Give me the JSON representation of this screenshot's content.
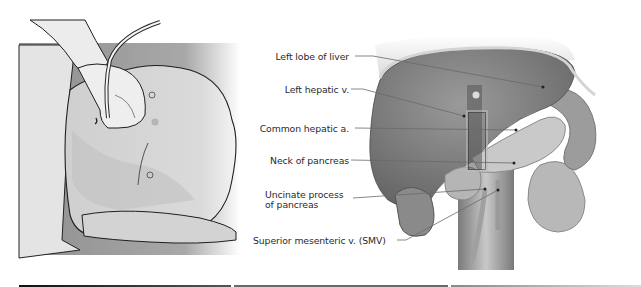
{
  "figure": {
    "left_panel": {
      "description": "Patient supine with ultrasound transducer placed on upper abdomen",
      "icons": [
        "transducer-icon",
        "hand-icon",
        "patient-torso-icon"
      ]
    },
    "right_panel": {
      "labels": [
        {
          "id": "left-lobe-liver",
          "text": "Left lobe of liver"
        },
        {
          "id": "left-hepatic-v",
          "text": "Left hepatic v."
        },
        {
          "id": "common-hepatic-a",
          "text": "Common hepatic a."
        },
        {
          "id": "neck-pancreas",
          "text": "Neck of pancreas"
        },
        {
          "id": "uncinate-line1",
          "text": "Uncinate process"
        },
        {
          "id": "uncinate-line2",
          "text": "of pancreas"
        },
        {
          "id": "smv",
          "text": "Superior mesenteric v. (SMV)"
        }
      ]
    },
    "colors": {
      "skin": "#d6d6d6",
      "organ_dark": "#6e6e6e",
      "organ_mid": "#8a8a8a",
      "label_text": "#2a2a2a",
      "leader_line": "#6a6a6a",
      "rule": "#333333"
    }
  }
}
